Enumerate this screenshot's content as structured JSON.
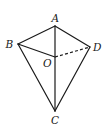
{
  "diagram": {
    "type": "geometry-figure",
    "points": {
      "A": {
        "label": "A",
        "x": 55,
        "y": 26,
        "label_x": 51.5,
        "label_y": 22
      },
      "B": {
        "label": "B",
        "x": 18,
        "y": 44,
        "label_x": 5.5,
        "label_y": 48
      },
      "D": {
        "label": "D",
        "x": 90,
        "y": 47,
        "label_x": 93,
        "label_y": 51
      },
      "O": {
        "label": "O",
        "x": 55,
        "y": 57,
        "label_x": 43,
        "label_y": 67
      },
      "C": {
        "label": "C",
        "x": 55,
        "y": 111,
        "label_x": 51,
        "label_y": 124
      }
    },
    "edges": [
      {
        "from": "A",
        "to": "B",
        "style": "solid"
      },
      {
        "from": "A",
        "to": "D",
        "style": "solid"
      },
      {
        "from": "A",
        "to": "C",
        "style": "solid"
      },
      {
        "from": "B",
        "to": "O",
        "style": "solid"
      },
      {
        "from": "B",
        "to": "C",
        "style": "solid"
      },
      {
        "from": "D",
        "to": "C",
        "style": "solid"
      },
      {
        "from": "O",
        "to": "D",
        "style": "dashed"
      }
    ],
    "colors": {
      "stroke": "#1a1a1a",
      "background": "#ffffff"
    }
  }
}
